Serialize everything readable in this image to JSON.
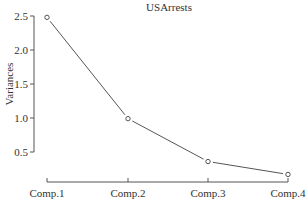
{
  "chart_data": {
    "type": "line",
    "title": "USArrests",
    "xlabel": "",
    "ylabel": "Variances",
    "categories": [
      "Comp.1",
      "Comp.2",
      "Comp.3",
      "Comp.4"
    ],
    "values": [
      2.48,
      0.99,
      0.36,
      0.17
    ],
    "yticks": [
      "0.5",
      "1.0",
      "1.5",
      "2.0",
      "2.5"
    ],
    "ylim": [
      0.17,
      2.5
    ],
    "grid": false,
    "legend": null,
    "marker": "open-circle",
    "colors": {
      "line": "#555555",
      "axis": "#555555",
      "text": "#333333"
    }
  }
}
